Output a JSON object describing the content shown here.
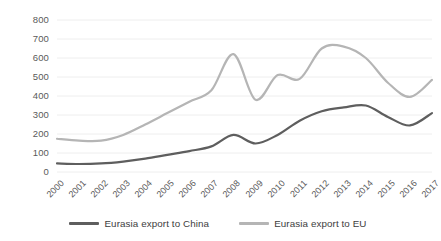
{
  "chart_data": {
    "type": "line",
    "title": "",
    "subtitle": "",
    "xlabel": "",
    "ylabel": "",
    "x": [
      "2000",
      "2001",
      "2002",
      "2003",
      "2004",
      "2005",
      "2006",
      "2007",
      "2008",
      "2009",
      "2010",
      "2011",
      "2012",
      "2013",
      "2014",
      "2015",
      "2016",
      "2017"
    ],
    "categories": [
      "2000",
      "2001",
      "2002",
      "2003",
      "2004",
      "2005",
      "2006",
      "2007",
      "2008",
      "2009",
      "2010",
      "2011",
      "2012",
      "2013",
      "2014",
      "2015",
      "2016",
      "2017"
    ],
    "series": [
      {
        "name": "Eurasia export to China",
        "color": "#5e5e5e",
        "values": [
          45,
          42,
          45,
          55,
          70,
          90,
          110,
          135,
          195,
          150,
          195,
          270,
          320,
          340,
          350,
          290,
          245,
          310
        ]
      },
      {
        "name": "Eurasia export to EU",
        "color": "#b5b5b5",
        "values": [
          175,
          165,
          165,
          195,
          250,
          310,
          370,
          430,
          620,
          380,
          510,
          490,
          650,
          660,
          600,
          470,
          395,
          485
        ]
      }
    ],
    "ylim": [
      0,
      800
    ],
    "yticks": [
      "0",
      "100",
      "200",
      "300",
      "400",
      "500",
      "600",
      "700",
      "800"
    ],
    "ytick_values": [
      0,
      100,
      200,
      300,
      400,
      500,
      600,
      700,
      800
    ],
    "grid": true,
    "grid_axis": "y",
    "legend_position": "bottom",
    "smoothing": "spline"
  },
  "axes": {
    "y_labels": [
      "800",
      "700",
      "600",
      "500",
      "400",
      "300",
      "200",
      "100",
      "0"
    ],
    "x_labels": [
      "2000",
      "2001",
      "2002",
      "2003",
      "2004",
      "2005",
      "2006",
      "2007",
      "2008",
      "2009",
      "2010",
      "2011",
      "2012",
      "2013",
      "2014",
      "2015",
      "2016",
      "2017"
    ]
  },
  "legend": {
    "items": [
      {
        "label": "Eurasia export to China",
        "color": "#5e5e5e"
      },
      {
        "label": "Eurasia export to EU",
        "color": "#b5b5b5"
      }
    ]
  },
  "style": {
    "gridline_color": "#eeeeee",
    "text_color": "#5a5a5a",
    "background": "#ffffff"
  }
}
